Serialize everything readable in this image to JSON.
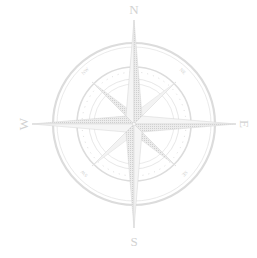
{
  "compass": {
    "center": [
      134,
      124
    ],
    "colors": {
      "background": "#ffffff",
      "line": "#dcdcdc",
      "fill": "#d6d6d6",
      "light_fill": "#f2f2f2",
      "label": "#d2d2d2"
    },
    "cardinal_labels": {
      "north": "N",
      "east": "E",
      "south": "S",
      "west": "W"
    },
    "intercardinal_labels": {
      "northeast": "NE",
      "southeast": "SE",
      "southwest": "SW",
      "northwest": "NW"
    }
  }
}
